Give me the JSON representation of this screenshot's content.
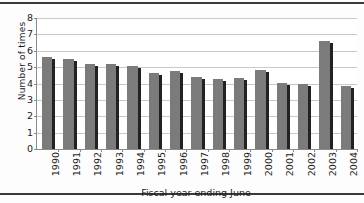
{
  "chart_data": {
    "type": "bar",
    "title": "",
    "xlabel": "Fiscal year ending June",
    "ylabel": "Number of  times",
    "categories": [
      "1990",
      "1991",
      "1992",
      "1993",
      "1994",
      "1995",
      "1996",
      "1997",
      "1998",
      "1999",
      "2000",
      "2001",
      "2002",
      "2003",
      "2004"
    ],
    "values": [
      5.6,
      5.5,
      5.2,
      5.2,
      5.1,
      4.65,
      4.75,
      4.4,
      4.3,
      4.35,
      4.85,
      4.05,
      4.0,
      6.6,
      3.85
    ],
    "ylim": [
      0,
      8
    ],
    "yticks": [
      0,
      1,
      2,
      3,
      4,
      5,
      6,
      7,
      8
    ],
    "ytick_labels": [
      "0",
      "1",
      "2",
      "3",
      "4",
      "5",
      "6",
      "7",
      "8"
    ],
    "grid": true,
    "legend": "none",
    "bar_color": "#7b7b7b",
    "bar_edge_color": "#222222",
    "gridline_color": "#c9c9c9",
    "axis_color": "#8a8a8a",
    "plot_background": "#ffffff",
    "figure_background": "#fdfdfd",
    "border_color": "#3a3a3a",
    "label_rotation_x": -90,
    "label_rotation_y": -90
  }
}
